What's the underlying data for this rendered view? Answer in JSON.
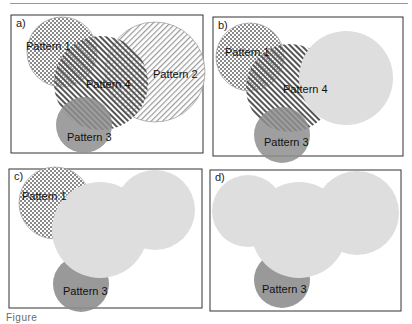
{
  "figure": {
    "caption_fragment": "Figure",
    "colors": {
      "frame": "#333333",
      "pattern1_dot": "#8a8a8a",
      "pattern2_line": "#9a9a9a",
      "pattern4_line": "#555555",
      "pattern3_fill": "#8e8e8e",
      "merged_fill": "#dedede"
    },
    "panels": [
      {
        "label": "a)",
        "circles": [
          {
            "name": "Pattern 1",
            "fill": "checker"
          },
          {
            "name": "Pattern 2",
            "fill": "thin-diagonal-hatch"
          },
          {
            "name": "Pattern 4",
            "fill": "thick-diagonal-hatch"
          },
          {
            "name": "Pattern 3",
            "fill": "solid-gray"
          }
        ]
      },
      {
        "label": "b)",
        "circles": [
          {
            "name": "Pattern 1",
            "fill": "checker"
          },
          {
            "name": "Pattern 4",
            "fill": "thick-diagonal-hatch"
          },
          {
            "name": "Pattern 3",
            "fill": "solid-gray"
          }
        ],
        "merged_regions": 1
      },
      {
        "label": "c)",
        "circles": [
          {
            "name": "Pattern 1",
            "fill": "checker"
          },
          {
            "name": "Pattern 3",
            "fill": "solid-gray"
          }
        ],
        "merged_regions": 1
      },
      {
        "label": "d)",
        "circles": [
          {
            "name": "Pattern 3",
            "fill": "solid-gray"
          }
        ],
        "merged_regions": 1
      }
    ]
  }
}
